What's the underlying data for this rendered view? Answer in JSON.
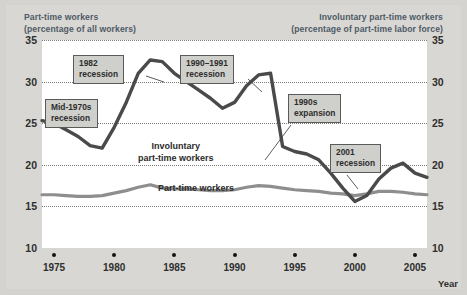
{
  "header": {
    "left_line1": "Part-time workers",
    "left_line2": "(percentage of all workers)",
    "right_line1": "Involuntary part-time workers",
    "right_line2": "(percentage of part-time labor force)"
  },
  "axis": {
    "x_title": "Year",
    "y_ticks": [
      "35",
      "30",
      "25",
      "20",
      "15",
      "10"
    ],
    "x_ticks": [
      "1975",
      "1980",
      "1985",
      "1990",
      "1995",
      "2000",
      "2005"
    ]
  },
  "series_labels": {
    "involuntary_line1": "Involuntary",
    "involuntary_line2": "part-time workers",
    "parttime": "Part-time workers"
  },
  "callouts": [
    {
      "line1": "1982",
      "line2": "recession"
    },
    {
      "line1": "Mid-1970s",
      "line2": "recession"
    },
    {
      "line1": "1990–1991",
      "line2": "recession"
    },
    {
      "line1": "1990s",
      "line2": "expansion"
    },
    {
      "line1": "2001",
      "line2": "recession"
    }
  ],
  "colors": {
    "background": "#d4d3cf",
    "plot_background": "#ffffff",
    "involuntary_line": "#4a4a4a",
    "parttime_line": "#8e8e8e",
    "gridline": "#7b7b7b",
    "header_text": "#4e5a66",
    "callout_fill": "#cfcfcb"
  },
  "chart_data": {
    "type": "line",
    "title": "",
    "xlabel": "Year",
    "ylabel": "",
    "xlim": [
      1974,
      2006
    ],
    "ylim": [
      10,
      35
    ],
    "grid": true,
    "legend": "inline-labels",
    "x": [
      1974,
      1975,
      1976,
      1977,
      1978,
      1979,
      1980,
      1981,
      1982,
      1983,
      1984,
      1985,
      1986,
      1987,
      1988,
      1989,
      1990,
      1991,
      1992,
      1993,
      1994,
      1995,
      1996,
      1997,
      1998,
      1999,
      2000,
      2001,
      2002,
      2003,
      2004,
      2005,
      2006
    ],
    "series": [
      {
        "name": "Involuntary part-time workers",
        "axis": "right",
        "unit": "percentage of part-time labor force",
        "color": "#4a4a4a",
        "values": [
          25.3,
          25.0,
          24.2,
          23.4,
          22.3,
          22.0,
          24.5,
          27.5,
          31.0,
          32.6,
          32.4,
          31.0,
          30.0,
          29.0,
          28.0,
          26.8,
          27.5,
          29.5,
          30.8,
          31.0,
          22.2,
          21.6,
          21.3,
          20.6,
          19.0,
          17.2,
          15.6,
          16.3,
          18.3,
          19.6,
          20.2,
          19.0,
          18.5
        ]
      },
      {
        "name": "Part-time workers",
        "axis": "left",
        "unit": "percentage of all workers",
        "color": "#8e8e8e",
        "values": [
          16.4,
          16.4,
          16.3,
          16.2,
          16.2,
          16.3,
          16.6,
          16.9,
          17.3,
          17.6,
          17.2,
          17.1,
          17.1,
          17.0,
          16.9,
          16.9,
          17.0,
          17.3,
          17.5,
          17.4,
          17.2,
          17.0,
          16.9,
          16.8,
          16.6,
          16.5,
          16.3,
          16.5,
          16.8,
          16.8,
          16.7,
          16.5,
          16.4
        ]
      }
    ],
    "annotations": [
      {
        "text": "Mid-1970s recession",
        "points_to_x": 1978,
        "points_to_series": "Involuntary part-time workers"
      },
      {
        "text": "1982 recession",
        "points_to_x": 1982.5,
        "points_to_series": "Involuntary part-time workers"
      },
      {
        "text": "1990–1991 recession",
        "points_to_x": 1993,
        "points_to_series": "Involuntary part-time workers"
      },
      {
        "text": "1990s expansion",
        "points_to_x": 1996,
        "points_to_series": "Involuntary part-time workers"
      },
      {
        "text": "2001 recession",
        "points_to_x": 2003.5,
        "points_to_series": "Involuntary part-time workers"
      }
    ]
  }
}
